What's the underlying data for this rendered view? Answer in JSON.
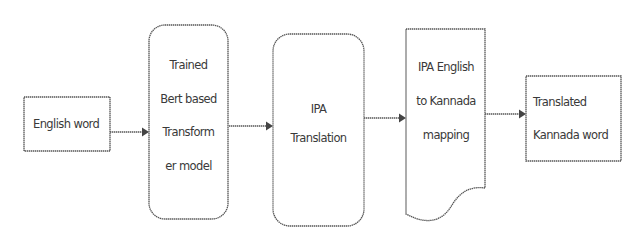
{
  "diagram": {
    "type": "flowchart",
    "direction": "left-to-right",
    "colors": {
      "stroke": "#555555",
      "text": "#3a3a3a",
      "background": "#ffffff"
    },
    "nodes": [
      {
        "id": "english_word",
        "shape": "rectangle",
        "lines": [
          "English word"
        ]
      },
      {
        "id": "bert_model",
        "shape": "rounded-rectangle",
        "lines": [
          "Trained",
          "Bert based",
          "Transform",
          "er model"
        ]
      },
      {
        "id": "ipa_translation",
        "shape": "rounded-rectangle",
        "lines": [
          "IPA",
          "Translation"
        ]
      },
      {
        "id": "ipa_mapping",
        "shape": "document",
        "lines": [
          "IPA English",
          "to Kannada",
          "mapping"
        ]
      },
      {
        "id": "kannada_word",
        "shape": "rectangle",
        "lines": [
          "Translated",
          "Kannada word"
        ]
      }
    ],
    "edges": [
      {
        "from": "english_word",
        "to": "bert_model"
      },
      {
        "from": "bert_model",
        "to": "ipa_translation"
      },
      {
        "from": "ipa_translation",
        "to": "ipa_mapping"
      },
      {
        "from": "ipa_mapping",
        "to": "kannada_word"
      }
    ]
  }
}
